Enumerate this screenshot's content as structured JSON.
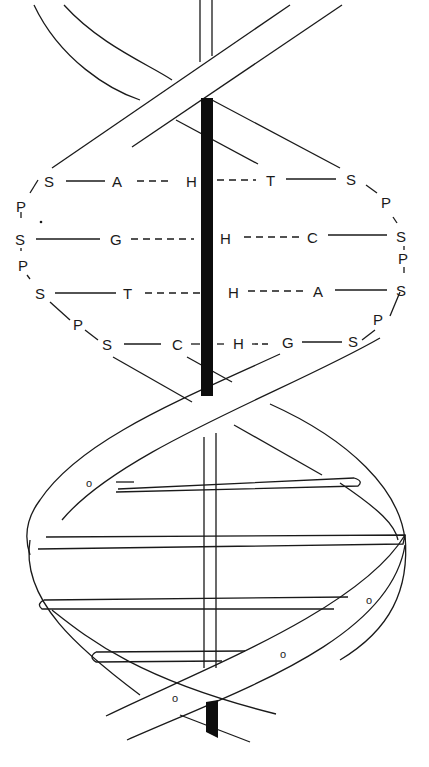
{
  "diagram": {
    "colors": {
      "stroke": "#1a1a1a",
      "axis": "#0d0d0d",
      "background": "#ffffff"
    },
    "base_pairs": [
      {
        "left_sugar": "S",
        "left_base": "A",
        "bond": "H",
        "right_base": "T",
        "right_sugar": "S"
      },
      {
        "left_sugar": "S",
        "left_base": "G",
        "bond": "H",
        "right_base": "C",
        "right_sugar": "S"
      },
      {
        "left_sugar": "S",
        "left_base": "T",
        "bond": "H",
        "right_base": "A",
        "right_sugar": "S"
      },
      {
        "left_sugar": "S",
        "left_base": "C",
        "bond": "H",
        "right_base": "G",
        "right_sugar": "S"
      }
    ],
    "left_backbone": [
      "P",
      "P",
      "P"
    ],
    "right_backbone": [
      "P",
      "P",
      "P"
    ],
    "ribbon_markers": [
      "o",
      "o",
      "o",
      "o"
    ]
  }
}
